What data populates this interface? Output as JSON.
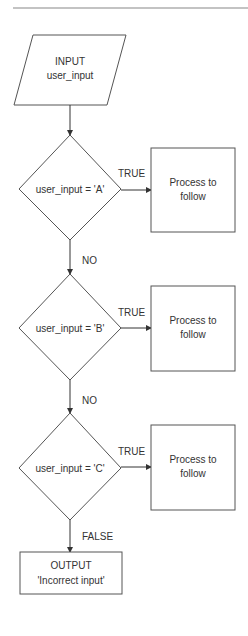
{
  "diagram": {
    "type": "flowchart",
    "colors": {
      "stroke": "#555555",
      "text": "#333333",
      "background": "#ffffff",
      "rule": "#888888"
    },
    "input": {
      "line1": "INPUT",
      "line2": "user_input"
    },
    "decisions": [
      {
        "condition": "user_input = 'A'",
        "true_label": "TRUE",
        "process": {
          "line1": "Process to",
          "line2": "follow"
        }
      },
      {
        "condition": "user_input = 'B'",
        "true_label": "TRUE",
        "process": {
          "line1": "Process to",
          "line2": "follow"
        }
      },
      {
        "condition": "user_input = 'C'",
        "true_label": "TRUE",
        "process": {
          "line1": "Process to",
          "line2": "follow"
        }
      }
    ],
    "no_labels": [
      "NO",
      "NO"
    ],
    "false_label": "FALSE",
    "output": {
      "line1": "OUTPUT",
      "line2": "'Incorrect input'"
    }
  }
}
